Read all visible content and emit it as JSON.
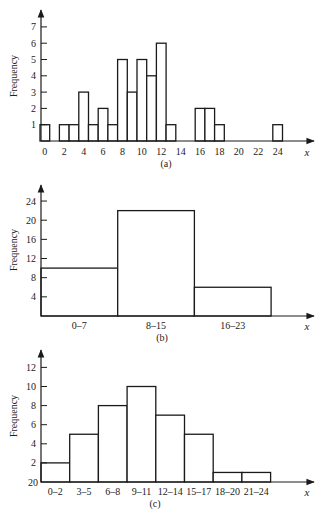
{
  "chart_data": [
    {
      "id": "a",
      "type": "bar",
      "title": "",
      "caption": "(a)",
      "xlabel": "x",
      "ylabel": "Frequency",
      "ylim": [
        0,
        7
      ],
      "yticks": [
        1,
        2,
        3,
        4,
        5,
        6,
        7
      ],
      "xticks": [
        0,
        2,
        4,
        6,
        8,
        10,
        12,
        14,
        16,
        18,
        20,
        22,
        24
      ],
      "grid": false,
      "categories": [
        0,
        1,
        2,
        3,
        4,
        5,
        6,
        7,
        8,
        9,
        10,
        11,
        12,
        13,
        14,
        15,
        16,
        17,
        18,
        19,
        20,
        21,
        22,
        23,
        24
      ],
      "values": [
        1,
        0,
        1,
        1,
        3,
        1,
        2,
        1,
        5,
        3,
        5,
        4,
        6,
        1,
        0,
        0,
        2,
        2,
        1,
        0,
        0,
        0,
        0,
        0,
        1
      ]
    },
    {
      "id": "b",
      "type": "bar",
      "title": "",
      "caption": "(b)",
      "xlabel": "x",
      "ylabel": "Frequency",
      "ylim": [
        0,
        24
      ],
      "yticks": [
        4,
        8,
        12,
        16,
        20,
        24
      ],
      "grid": false,
      "categories": [
        "0–7",
        "8–15",
        "16–23"
      ],
      "values": [
        10,
        22,
        6
      ]
    },
    {
      "id": "c",
      "type": "bar",
      "title": "",
      "caption": "(c)",
      "xlabel": "x",
      "ylabel": "Frequency",
      "ylim": [
        0,
        12
      ],
      "yticks": [
        2,
        4,
        6,
        8,
        10,
        12
      ],
      "ytick_base_label": "20",
      "grid": false,
      "categories": [
        "0–2",
        "3–5",
        "6–8",
        "9–11",
        "12–14",
        "15–17",
        "18–20",
        "21–24"
      ],
      "values": [
        2,
        5,
        8,
        10,
        7,
        5,
        1,
        1
      ]
    }
  ]
}
